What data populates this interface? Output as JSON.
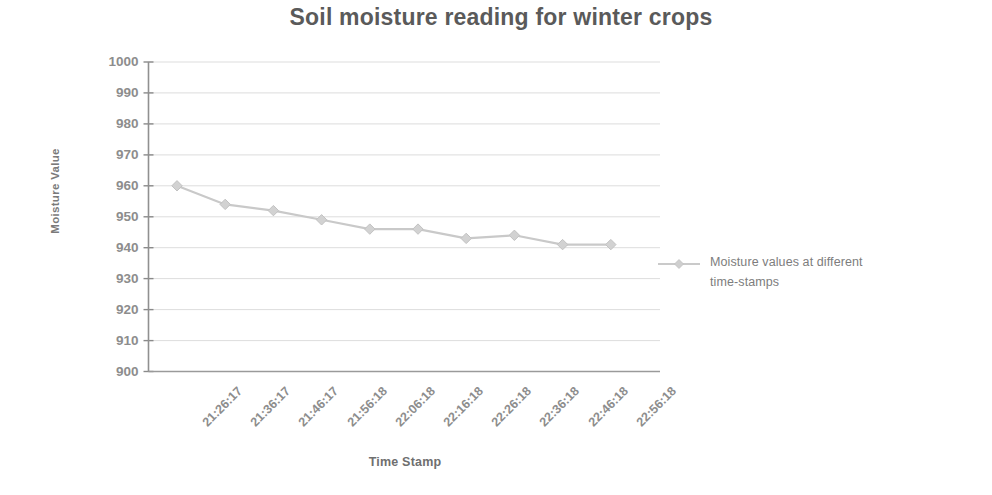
{
  "chart_data": {
    "type": "line",
    "title": "Soil moisture reading for winter crops",
    "xlabel": "Time Stamp",
    "ylabel": "Moisture Value",
    "categories": [
      "21:26:17",
      "21:36:17",
      "21:46:17",
      "21:56:18",
      "22:06:18",
      "22:16:18",
      "22:26:18",
      "22:36:18",
      "22:46:18",
      "22:56:18"
    ],
    "series": [
      {
        "name": "Moisture values at different time-stamps",
        "values": [
          960,
          954,
          952,
          949,
          946,
          946,
          943,
          944,
          941,
          941
        ]
      }
    ],
    "ylim": [
      900,
      1000
    ],
    "yticks": [
      1000,
      990,
      980,
      970,
      960,
      950,
      940,
      930,
      920,
      910,
      900
    ],
    "ytick_step": 10,
    "grid": "horizontal",
    "legend_position": "right",
    "marker": "diamond",
    "series_color": "#c9c9c9",
    "grid_color": "#d9d9d9",
    "axis_color": "#808080",
    "text_color": "#8d8d8d",
    "title_color": "#5a5a5a"
  },
  "legend": {
    "line1": "Moisture values at different",
    "line2": "time-stamps"
  }
}
